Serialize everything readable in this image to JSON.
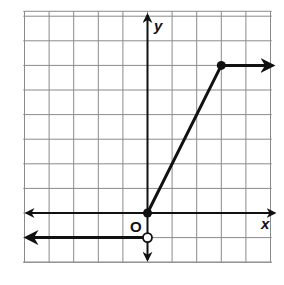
{
  "chart_data": {
    "type": "line",
    "title": "",
    "xlabel": "x",
    "ylabel": "y",
    "origin_label": "O",
    "xlim": [
      -5,
      5
    ],
    "ylim": [
      -1,
      8
    ],
    "grid": true,
    "grid_step": 1,
    "series": [
      {
        "name": "piece-left",
        "description": "horizontal ray y = -1 for x < 0, open circle at (0,-1), arrow pointing left",
        "points": [
          [
            -5,
            -1
          ],
          [
            0,
            -1
          ]
        ],
        "start": {
          "x": 0,
          "y": -1,
          "marker": "open"
        },
        "arrow": "left"
      },
      {
        "name": "piece-middle",
        "description": "segment y = 2x from (0,0) to (3,6), closed endpoints",
        "points": [
          [
            0,
            0
          ],
          [
            3,
            6
          ]
        ],
        "endpoints": [
          {
            "x": 0,
            "y": 0,
            "marker": "closed"
          },
          {
            "x": 3,
            "y": 6,
            "marker": "closed"
          }
        ]
      },
      {
        "name": "piece-right",
        "description": "horizontal ray y = 6 for x > 3, arrow pointing right",
        "points": [
          [
            3,
            6
          ],
          [
            5,
            6
          ]
        ],
        "arrow": "right"
      }
    ]
  },
  "labels": {
    "x_axis": "x",
    "y_axis": "y",
    "origin": "O"
  },
  "colors": {
    "grid": "#8a8a8a",
    "ink": "#111111",
    "background": "#ffffff"
  }
}
